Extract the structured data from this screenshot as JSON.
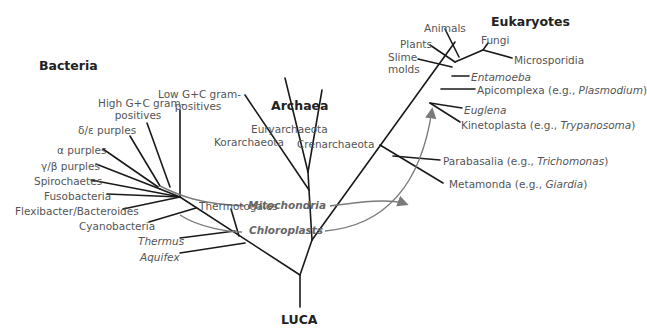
{
  "groups": {
    "bacteria": "Bacteria",
    "archaea": "Archaea",
    "eukaryotes": "Eukaryotes",
    "root": "LUCA"
  },
  "bacteria": {
    "low_gc_1": "Low G+C gram-",
    "low_gc_2": "positives",
    "high_gc_1": "High G+C gram-",
    "high_gc_2": "positives",
    "delta_epsilon": "δ/ε purples",
    "alpha": "α purples",
    "gamma_beta": "γ/β purples",
    "spirochaetes": "Spirochaetes",
    "fusobacteria": "Fusobacteria",
    "flexibacter": "Flexibacter/Bacteroides",
    "cyanobacteria": "Cyanobacteria",
    "thermotogales": "Thermotogales",
    "thermus": "Thermus",
    "aquifex": "Aquifex"
  },
  "archaea": {
    "euryarchaeota": "Euryarchaeota",
    "korarchaeota": "Korarchaeota",
    "crenarchaeota": "Crenarchaeota"
  },
  "eukaryotes": {
    "animals": "Animals",
    "fungi": "Fungi",
    "plants": "Plants",
    "slime_1": "Slime",
    "slime_2": "molds",
    "microsporidia": "Microsporidia",
    "entamoeba": "Entamoeba",
    "apicomplexa": "Apicomplexa (e.g., ",
    "apicomplexa_ex": "Plasmodium",
    "euglena": "Euglena",
    "kinetoplasta": "Kinetoplasta (e.g., ",
    "kinetoplasta_ex": "Trypanosoma",
    "parabasalia": "Parabasalia (e.g., ",
    "parabasalia_ex": "Trichomonas",
    "metamonda": "Metamonda (e.g., ",
    "metamonda_ex": "Giardia",
    "close_paren": ")"
  },
  "annotations": {
    "mitochondria": "Mitochondria",
    "chloroplasts": "Chloroplasts"
  },
  "colors": {
    "branch": "#1a1a1a",
    "arrow": "#7a7a7a",
    "label": "#555555"
  }
}
